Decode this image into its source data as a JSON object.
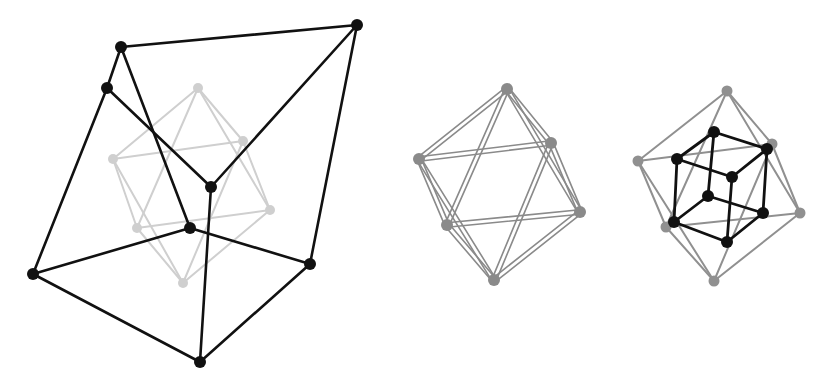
{
  "figure": {
    "panels": [
      {
        "id": "left",
        "layers": [
          {
            "name": "octahedron-faint",
            "color": "#cfcfcf",
            "node_radius": 5,
            "nodes": [
              [
                198,
                88
              ],
              [
                113,
                159
              ],
              [
                243,
                141
              ],
              [
                270,
                210
              ],
              [
                137,
                228
              ],
              [
                183,
                283
              ]
            ],
            "edges": [
              [
                0,
                1
              ],
              [
                0,
                2
              ],
              [
                0,
                3
              ],
              [
                0,
                4
              ],
              [
                5,
                1
              ],
              [
                5,
                2
              ],
              [
                5,
                3
              ],
              [
                5,
                4
              ],
              [
                1,
                2
              ],
              [
                2,
                3
              ],
              [
                3,
                4
              ],
              [
                4,
                1
              ]
            ]
          },
          {
            "name": "distorted-cube",
            "color": "#111111",
            "node_radius": 6,
            "nodes": [
              [
                121,
                47
              ],
              [
                357,
                25
              ],
              [
                107,
                88
              ],
              [
                211,
                187
              ],
              [
                190,
                228
              ],
              [
                33,
                274
              ],
              [
                310,
                264
              ],
              [
                200,
                362
              ]
            ],
            "edges": [
              [
                0,
                1
              ],
              [
                0,
                2
              ],
              [
                0,
                4
              ],
              [
                2,
                3
              ],
              [
                2,
                5
              ],
              [
                1,
                3
              ],
              [
                1,
                6
              ],
              [
                3,
                7
              ],
              [
                4,
                5
              ],
              [
                4,
                6
              ],
              [
                5,
                7
              ],
              [
                6,
                7
              ]
            ]
          }
        ]
      },
      {
        "id": "middle",
        "layers": [
          {
            "name": "octahedron-doubled",
            "color": "#8a8a8a",
            "node_radius": 6,
            "double_offset": 2.2,
            "nodes": [
              [
                507,
                89
              ],
              [
                419,
                159
              ],
              [
                551,
                143
              ],
              [
                580,
                212
              ],
              [
                447,
                225
              ],
              [
                494,
                280
              ]
            ],
            "edges": [
              [
                0,
                1
              ],
              [
                0,
                2
              ],
              [
                0,
                3
              ],
              [
                0,
                4
              ],
              [
                5,
                1
              ],
              [
                5,
                2
              ],
              [
                5,
                3
              ],
              [
                5,
                4
              ],
              [
                1,
                2
              ],
              [
                2,
                3
              ],
              [
                3,
                4
              ],
              [
                4,
                1
              ]
            ]
          }
        ]
      },
      {
        "id": "right",
        "layers": [
          {
            "name": "octahedron-outer",
            "color": "#909090",
            "node_radius": 5.5,
            "nodes": [
              [
                727,
                91
              ],
              [
                638,
                161
              ],
              [
                772,
                144
              ],
              [
                800,
                213
              ],
              [
                666,
                227
              ],
              [
                714,
                281
              ]
            ],
            "edges": [
              [
                0,
                1
              ],
              [
                0,
                2
              ],
              [
                0,
                3
              ],
              [
                0,
                4
              ],
              [
                5,
                1
              ],
              [
                5,
                2
              ],
              [
                5,
                3
              ],
              [
                5,
                4
              ],
              [
                1,
                2
              ],
              [
                2,
                3
              ],
              [
                3,
                4
              ],
              [
                4,
                1
              ]
            ]
          },
          {
            "name": "cube-inner",
            "color": "#111111",
            "node_radius": 6,
            "nodes": [
              [
                714,
                132
              ],
              [
                767,
                149
              ],
              [
                677,
                159
              ],
              [
                732,
                177
              ],
              [
                708,
                196
              ],
              [
                763,
                213
              ],
              [
                674,
                222
              ],
              [
                727,
                242
              ]
            ],
            "edges": [
              [
                0,
                1
              ],
              [
                0,
                2
              ],
              [
                2,
                3
              ],
              [
                1,
                3
              ],
              [
                0,
                4
              ],
              [
                1,
                5
              ],
              [
                2,
                6
              ],
              [
                3,
                7
              ],
              [
                4,
                5
              ],
              [
                4,
                6
              ],
              [
                6,
                7
              ],
              [
                5,
                7
              ]
            ]
          }
        ]
      }
    ]
  }
}
